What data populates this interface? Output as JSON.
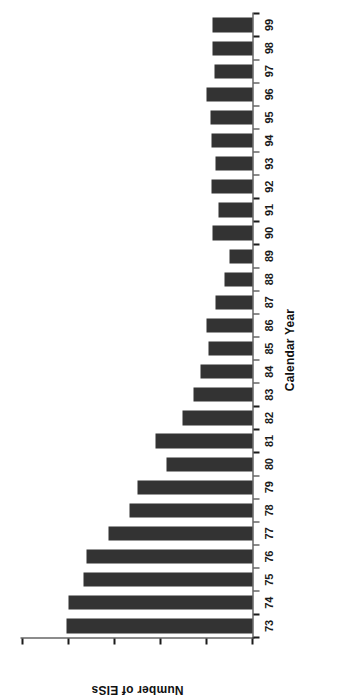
{
  "chart_data": {
    "type": "bar",
    "title": "",
    "xlabel": "Calendar Year",
    "ylabel": "Number of EISs",
    "grid": false,
    "legend": "none",
    "orientation": "page-rotated-90-ccw",
    "ylim": [
      0,
      2500
    ],
    "yticks": [
      0,
      500,
      1000,
      1500,
      2000,
      2500
    ],
    "ytick_labels": [
      "0",
      "500",
      "1000",
      "1500",
      "2000",
      "2500"
    ],
    "categories": [
      "73",
      "74",
      "75",
      "76",
      "77",
      "78",
      "79",
      "80",
      "81",
      "82",
      "83",
      "84",
      "85",
      "86",
      "87",
      "88",
      "89",
      "90",
      "91",
      "92",
      "93",
      "94",
      "95",
      "96",
      "97",
      "98",
      "99"
    ],
    "values": [
      2020,
      1995,
      1840,
      1800,
      1560,
      1340,
      1250,
      940,
      1050,
      760,
      640,
      560,
      480,
      500,
      400,
      300,
      255,
      440,
      375,
      450,
      405,
      450,
      460,
      495,
      415,
      430,
      435
    ],
    "bar_color": "#333333",
    "axis_color": "#1a1a1a",
    "background": "#ffffff"
  }
}
